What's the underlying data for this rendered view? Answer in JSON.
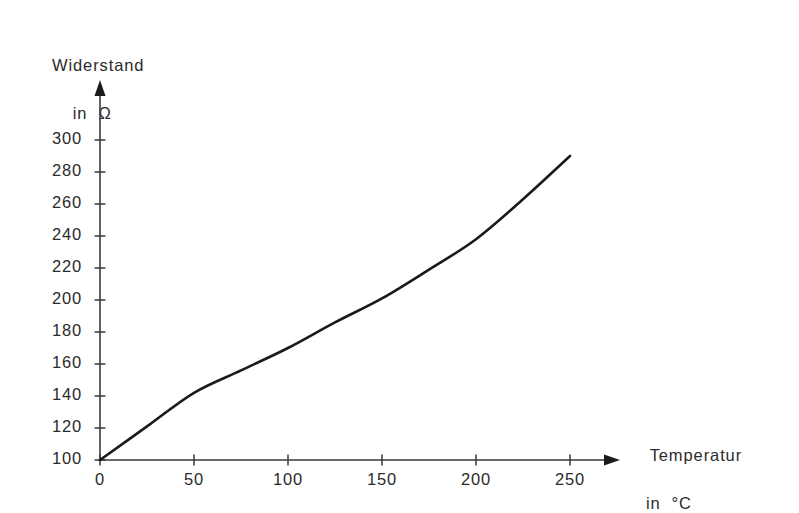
{
  "chart_data": {
    "type": "line",
    "title": "",
    "subtitle": "",
    "xlabel": "Temperatur in °C",
    "ylabel": "Widerstand in Ω",
    "xlabel_line1": "Temperatur",
    "xlabel_line2": "in  °C",
    "ylabel_line1": "Widerstand",
    "ylabel_line2": "in  Ω",
    "xlim": [
      0,
      250
    ],
    "ylim": [
      100,
      300
    ],
    "grid": false,
    "legend": false,
    "legend_position": "none",
    "xticks": [
      0,
      50,
      100,
      150,
      200,
      250
    ],
    "xtick_labels": [
      "0",
      "50",
      "100",
      "150",
      "200",
      "250"
    ],
    "yticks": [
      100,
      120,
      140,
      160,
      180,
      200,
      220,
      240,
      260,
      280,
      300
    ],
    "ytick_labels": [
      "100",
      "120",
      "140",
      "160",
      "180",
      "200",
      "220",
      "240",
      "260",
      "280",
      "300"
    ],
    "x": [
      0,
      25,
      50,
      75,
      100,
      125,
      150,
      175,
      200,
      225,
      250
    ],
    "series": [
      {
        "name": "Widerstand",
        "color": "#1a1a1a",
        "values": [
          100,
          121,
          142,
          156,
          170,
          186,
          201,
          219,
          238,
          263,
          290
        ]
      }
    ]
  },
  "axes": {
    "y_axis_name": "resistance-axis",
    "x_axis_name": "temperature-axis",
    "line_color": "#1a1a1a",
    "axis_color": "#3a3a3a"
  }
}
